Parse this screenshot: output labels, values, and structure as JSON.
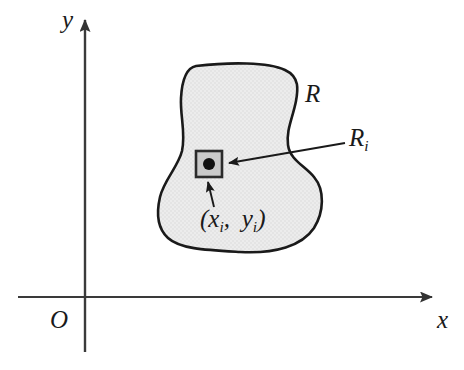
{
  "figure": {
    "background_color": "#ffffff",
    "axes": {
      "x_axis_label": "x",
      "y_axis_label": "y",
      "origin_label": "O",
      "axis_color": "#3a3a3a",
      "x_axis_start_px": 18,
      "x_axis_end_px": 440,
      "x_axis_y_px": 297,
      "y_axis_top_px": 8,
      "y_axis_bottom_px": 352,
      "y_axis_x_px": 85
    },
    "region": {
      "label": "R",
      "fill_color": "#ebebeb",
      "stroke_color": "#1a1a1a",
      "stroke_width": 2.6
    },
    "subregion": {
      "label": "R",
      "label_subscript": "i",
      "square_fill_color": "#c8c8c8",
      "square_stroke_color": "#2b2b2b",
      "square_left_px": 196,
      "square_top_px": 151,
      "square_size_px": 26
    },
    "sample_point": {
      "label_open": "(",
      "label_x": "x",
      "label_x_subscript": "i",
      "label_comma": ",",
      "label_y": "y",
      "label_y_subscript": "i",
      "label_close": ")",
      "dot_color": "#111111",
      "dot_center_x_px": 209,
      "dot_center_y_px": 164,
      "dot_radius_px": 6
    },
    "annotations": {
      "subregion_arrow_from_px": [
        345,
        143
      ],
      "subregion_arrow_to_px": [
        226,
        163
      ],
      "point_arrow_from_px": [
        213,
        207
      ],
      "point_arrow_to_px": [
        208,
        179
      ],
      "arrow_color": "#1a1a1a"
    }
  }
}
